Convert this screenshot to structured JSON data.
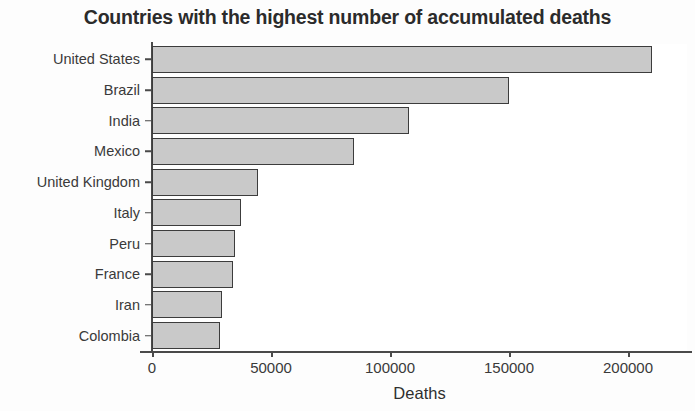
{
  "chart_data": {
    "type": "bar",
    "orientation": "horizontal",
    "title": "Countries with the highest number of accumulated deaths",
    "xlabel": "Deaths",
    "ylabel": "",
    "categories": [
      "United States",
      "Brazil",
      "India",
      "Mexico",
      "United Kingdom",
      "Italy",
      "Peru",
      "France",
      "Iran",
      "Colombia"
    ],
    "values": [
      210000,
      150000,
      108000,
      85000,
      44500,
      37400,
      35000,
      34000,
      29400,
      28600
    ],
    "xlim": [
      0,
      225000
    ],
    "xticks": [
      0,
      50000,
      100000,
      150000,
      200000
    ],
    "xtick_labels": [
      "0",
      "50000",
      "100000",
      "150000",
      "200000"
    ],
    "grid": false,
    "legend": false,
    "bar_fill": "#c9c9c9",
    "bar_border": "#3c3c3c",
    "axis_color": "#4a4a4a",
    "background": "#ffffff"
  }
}
